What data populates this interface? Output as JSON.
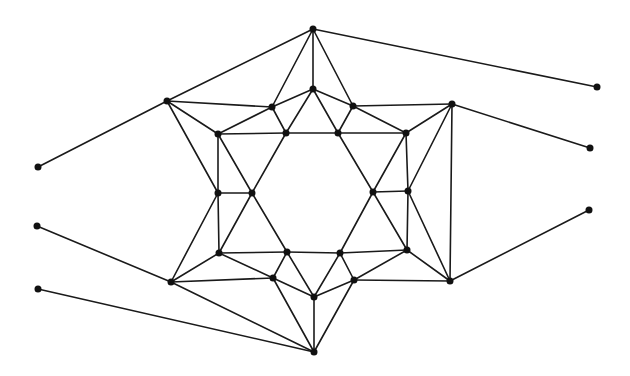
{
  "diagram": {
    "type": "graph",
    "directed": false,
    "colors": {
      "edge": "#1a1a1a",
      "node": "#111111",
      "background": "#ffffff"
    },
    "node_radius": 3.5,
    "nodes": [
      {
        "id": "T",
        "x": 313,
        "y": 29
      },
      {
        "id": "UL",
        "x": 167,
        "y": 101
      },
      {
        "id": "UR",
        "x": 452,
        "y": 104
      },
      {
        "id": "LL",
        "x": 171,
        "y": 282
      },
      {
        "id": "LR",
        "x": 450,
        "y": 281
      },
      {
        "id": "B",
        "x": 314,
        "y": 352
      },
      {
        "id": "a1",
        "x": 272,
        "y": 107
      },
      {
        "id": "a2",
        "x": 313,
        "y": 89
      },
      {
        "id": "a3",
        "x": 353,
        "y": 106
      },
      {
        "id": "s1",
        "x": 218,
        "y": 134
      },
      {
        "id": "s2",
        "x": 286,
        "y": 133
      },
      {
        "id": "s3",
        "x": 338,
        "y": 133
      },
      {
        "id": "s4",
        "x": 406,
        "y": 133
      },
      {
        "id": "m1",
        "x": 218,
        "y": 193
      },
      {
        "id": "m2",
        "x": 252,
        "y": 193
      },
      {
        "id": "m3",
        "x": 373,
        "y": 192
      },
      {
        "id": "m4",
        "x": 408,
        "y": 191
      },
      {
        "id": "d1",
        "x": 219,
        "y": 253
      },
      {
        "id": "d2",
        "x": 287,
        "y": 252
      },
      {
        "id": "d3",
        "x": 340,
        "y": 253
      },
      {
        "id": "d4",
        "x": 407,
        "y": 250
      },
      {
        "id": "b1",
        "x": 273,
        "y": 278
      },
      {
        "id": "b2",
        "x": 314,
        "y": 297
      },
      {
        "id": "b3",
        "x": 354,
        "y": 280
      },
      {
        "id": "oL1",
        "x": 38,
        "y": 167
      },
      {
        "id": "oL2",
        "x": 37,
        "y": 226
      },
      {
        "id": "oL3",
        "x": 38,
        "y": 289
      },
      {
        "id": "oR1",
        "x": 597,
        "y": 87
      },
      {
        "id": "oR2",
        "x": 590,
        "y": 148
      },
      {
        "id": "oR3",
        "x": 589,
        "y": 210
      }
    ],
    "edges": [
      [
        "T",
        "UL"
      ],
      [
        "T",
        "a1"
      ],
      [
        "T",
        "a2"
      ],
      [
        "T",
        "a3"
      ],
      [
        "T",
        "oR1"
      ],
      [
        "UL",
        "oL1"
      ],
      [
        "UL",
        "a1"
      ],
      [
        "UL",
        "s1"
      ],
      [
        "UL",
        "m1"
      ],
      [
        "a1",
        "a2"
      ],
      [
        "a1",
        "s1"
      ],
      [
        "a1",
        "s2"
      ],
      [
        "a2",
        "a3"
      ],
      [
        "a2",
        "s2"
      ],
      [
        "a2",
        "s3"
      ],
      [
        "a3",
        "UR"
      ],
      [
        "a3",
        "s4"
      ],
      [
        "a3",
        "s3"
      ],
      [
        "UR",
        "oR2"
      ],
      [
        "UR",
        "s4"
      ],
      [
        "UR",
        "m4"
      ],
      [
        "UR",
        "LR"
      ],
      [
        "s1",
        "s2"
      ],
      [
        "s2",
        "s3"
      ],
      [
        "s3",
        "s4"
      ],
      [
        "s1",
        "m1"
      ],
      [
        "m1",
        "d1"
      ],
      [
        "s4",
        "m4"
      ],
      [
        "m4",
        "d4"
      ],
      [
        "s1",
        "m2"
      ],
      [
        "m2",
        "d2"
      ],
      [
        "s2",
        "m2"
      ],
      [
        "m2",
        "d1"
      ],
      [
        "s3",
        "m3"
      ],
      [
        "m3",
        "d4"
      ],
      [
        "s4",
        "m3"
      ],
      [
        "m3",
        "d3"
      ],
      [
        "m1",
        "m2"
      ],
      [
        "m3",
        "m4"
      ],
      [
        "m1",
        "LL"
      ],
      [
        "m4",
        "LR"
      ],
      [
        "d1",
        "d2"
      ],
      [
        "d2",
        "d3"
      ],
      [
        "d3",
        "d4"
      ],
      [
        "d1",
        "LL"
      ],
      [
        "d1",
        "b1"
      ],
      [
        "d4",
        "LR"
      ],
      [
        "d4",
        "b3"
      ],
      [
        "LL",
        "b1"
      ],
      [
        "LR",
        "b3"
      ],
      [
        "d2",
        "b1"
      ],
      [
        "d2",
        "b2"
      ],
      [
        "d3",
        "b3"
      ],
      [
        "d3",
        "b2"
      ],
      [
        "b1",
        "b2"
      ],
      [
        "b2",
        "b3"
      ],
      [
        "b1",
        "B"
      ],
      [
        "b3",
        "B"
      ],
      [
        "b2",
        "B"
      ],
      [
        "LL",
        "B"
      ],
      [
        "oL3",
        "B"
      ],
      [
        "oL2",
        "LL"
      ],
      [
        "LR",
        "oR3"
      ]
    ]
  }
}
